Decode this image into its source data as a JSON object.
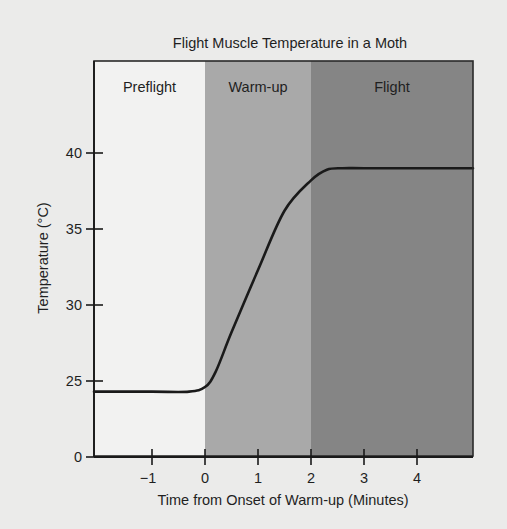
{
  "chart_data": {
    "type": "line",
    "title": "Flight Muscle Temperature in a Moth",
    "xlabel": "Time from Onset of Warm-up (Minutes)",
    "ylabel": "Temperature (°C)",
    "xlim": [
      -2.1,
      5.1
    ],
    "ylim": [
      0,
      45
    ],
    "y_axis_break": true,
    "x_ticks": [
      -1,
      0,
      1,
      2,
      3,
      4
    ],
    "x_tick_labels": [
      "−1",
      "0",
      "1",
      "2",
      "3",
      "4"
    ],
    "y_ticks": [
      0,
      25,
      30,
      35,
      40
    ],
    "y_tick_labels": [
      "0",
      "25",
      "30",
      "35",
      "40"
    ],
    "grid": false,
    "legend": null,
    "regions": [
      {
        "label": "Preflight",
        "x_start": -2.1,
        "x_end": 0,
        "color": "#f2f2f1"
      },
      {
        "label": "Warm-up",
        "x_start": 0,
        "x_end": 2,
        "color": "#a9a9a9"
      },
      {
        "label": "Flight",
        "x_start": 2,
        "x_end": 5.1,
        "color": "#858585"
      }
    ],
    "series": [
      {
        "name": "Flight muscle temperature",
        "color": "#1a1a1a",
        "x": [
          -2.1,
          -1.0,
          -0.3,
          0.0,
          0.2,
          0.5,
          1.0,
          1.5,
          2.0,
          2.3,
          2.6,
          3.0,
          4.0,
          5.1
        ],
        "y": [
          24.3,
          24.3,
          24.3,
          24.6,
          25.6,
          28.2,
          32.3,
          36.2,
          38.2,
          38.9,
          39.0,
          39.0,
          39.0,
          39.0
        ]
      }
    ]
  }
}
